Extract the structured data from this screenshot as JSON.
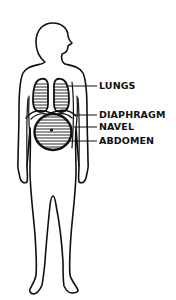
{
  "diagram": {
    "labels": [
      {
        "id": "lungs",
        "text": "LUNGS"
      },
      {
        "id": "diaphragm",
        "text": "DIAPHRAGM"
      },
      {
        "id": "navel",
        "text": "NAVEL"
      },
      {
        "id": "abdomen",
        "text": "ABDOMEN"
      }
    ],
    "colors": {
      "line": "#111111",
      "background": "#ffffff"
    }
  }
}
